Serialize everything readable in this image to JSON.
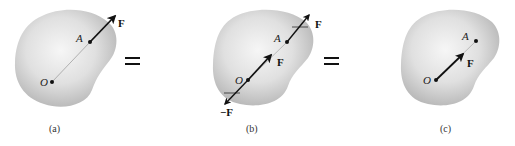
{
  "diagram": {
    "colors": {
      "body_fill_center": "#f4f4f4",
      "body_fill_edge": "#b9b9b9",
      "arrow": "#111111",
      "line": "#777777"
    },
    "panels": [
      {
        "id": "a",
        "caption": "(a)",
        "point_O": "O",
        "point_A": "A",
        "forces": [
          {
            "label": "F",
            "applied_at": "A"
          }
        ]
      },
      {
        "id": "b",
        "caption": "(b)",
        "point_O": "O",
        "point_A": "A",
        "forces": [
          {
            "label": "F",
            "applied_at": "A"
          },
          {
            "label": "F",
            "applied_at": "O"
          },
          {
            "label": "−F",
            "applied_at": "O"
          }
        ]
      },
      {
        "id": "c",
        "caption": "(c)",
        "point_O": "O",
        "point_A": "A",
        "forces": [
          {
            "label": "F",
            "applied_at": "O"
          }
        ]
      }
    ],
    "equals_signs": [
      "=",
      "="
    ]
  }
}
